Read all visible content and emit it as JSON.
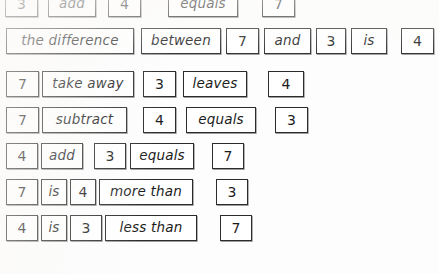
{
  "document": {
    "title": "Number sentence word cards worksheet",
    "caption": "",
    "paper_color": "#fdfdfd",
    "ink_color": "#1c1c1c",
    "border_color": "#2b2b2b"
  },
  "rows": [
    {
      "id": "row-1",
      "sentence": "3 add 4 equals 7",
      "cards": [
        {
          "text": "3",
          "type": "number",
          "left": 5,
          "width": 33
        },
        {
          "text": "add",
          "type": "word",
          "left": 48,
          "width": 48
        },
        {
          "text": "4",
          "type": "number",
          "left": 108,
          "width": 33
        },
        {
          "text": "equals",
          "type": "word",
          "left": 168,
          "width": 70
        },
        {
          "text": "7",
          "type": "number",
          "left": 262,
          "width": 33
        }
      ]
    },
    {
      "id": "row-2",
      "sentence": "the difference between 7 and 3 is 4",
      "cards": [
        {
          "text": "the difference",
          "type": "word",
          "left": 6,
          "width": 128
        },
        {
          "text": "between",
          "type": "word",
          "left": 141,
          "width": 80
        },
        {
          "text": "7",
          "type": "number",
          "left": 226,
          "width": 33
        },
        {
          "text": "and",
          "type": "word",
          "left": 264,
          "width": 47
        },
        {
          "text": "3",
          "type": "number",
          "left": 316,
          "width": 30
        },
        {
          "text": "is",
          "type": "word",
          "left": 351,
          "width": 36
        },
        {
          "text": "4",
          "type": "number",
          "left": 401,
          "width": 33
        }
      ]
    },
    {
      "id": "row-3",
      "sentence": "7 take away 3 leaves 4",
      "cards": [
        {
          "text": "7",
          "type": "number",
          "left": 6,
          "width": 33
        },
        {
          "text": "take away",
          "type": "word",
          "left": 42,
          "width": 92
        },
        {
          "text": "3",
          "type": "number",
          "left": 143,
          "width": 33
        },
        {
          "text": "leaves",
          "type": "word",
          "left": 183,
          "width": 64
        },
        {
          "text": "4",
          "type": "number",
          "left": 268,
          "width": 36
        }
      ]
    },
    {
      "id": "row-4",
      "sentence": "7 subtract 4 equals 3",
      "cards": [
        {
          "text": "7",
          "type": "number",
          "left": 6,
          "width": 33
        },
        {
          "text": "subtract",
          "type": "word",
          "left": 42,
          "width": 85
        },
        {
          "text": "4",
          "type": "number",
          "left": 143,
          "width": 33
        },
        {
          "text": "equals",
          "type": "word",
          "left": 186,
          "width": 70
        },
        {
          "text": "3",
          "type": "number",
          "left": 275,
          "width": 33
        }
      ]
    },
    {
      "id": "row-5",
      "sentence": "4 add 3 equals 7",
      "cards": [
        {
          "text": "4",
          "type": "number",
          "left": 6,
          "width": 32
        },
        {
          "text": "add",
          "type": "word",
          "left": 41,
          "width": 42
        },
        {
          "text": "3",
          "type": "number",
          "left": 94,
          "width": 32
        },
        {
          "text": "equals",
          "type": "word",
          "left": 130,
          "width": 64
        },
        {
          "text": "7",
          "type": "number",
          "left": 212,
          "width": 32
        }
      ]
    },
    {
      "id": "row-6",
      "sentence": "7 is 4 more than 3",
      "cards": [
        {
          "text": "7",
          "type": "number",
          "left": 6,
          "width": 32
        },
        {
          "text": "is",
          "type": "word",
          "left": 41,
          "width": 26
        },
        {
          "text": "4",
          "type": "number",
          "left": 70,
          "width": 26
        },
        {
          "text": "more than",
          "type": "word",
          "left": 99,
          "width": 94
        },
        {
          "text": "3",
          "type": "number",
          "left": 216,
          "width": 32
        }
      ]
    },
    {
      "id": "row-7",
      "sentence": "4 is 3 less than 7",
      "cards": [
        {
          "text": "4",
          "type": "number",
          "left": 6,
          "width": 32
        },
        {
          "text": "is",
          "type": "word",
          "left": 41,
          "width": 26
        },
        {
          "text": "3",
          "type": "number",
          "left": 70,
          "width": 32
        },
        {
          "text": "less than",
          "type": "word",
          "left": 105,
          "width": 92
        },
        {
          "text": "7",
          "type": "number",
          "left": 220,
          "width": 32
        }
      ]
    }
  ]
}
